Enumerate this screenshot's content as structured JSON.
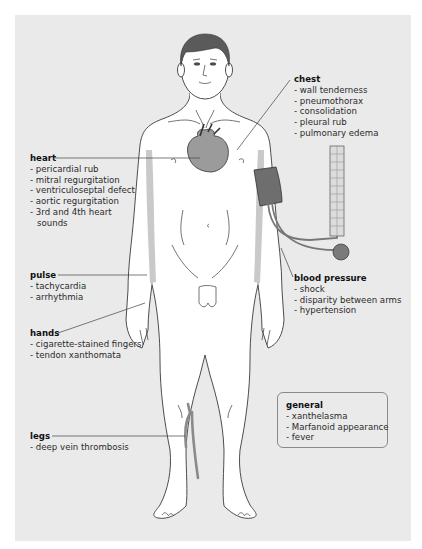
{
  "figure": {
    "colors": {
      "background": "#ffffff",
      "panel": "#eaeaea",
      "skin": "#ffffff",
      "outline": "#3a3a3a",
      "highlight": "#9b9b9b",
      "hair": "#5a5a5a",
      "leader_line": "#444444"
    }
  },
  "labels": {
    "chest": {
      "title": "chest",
      "items": [
        "- wall tenderness",
        "- pneumothorax",
        "- consolidation",
        "- pleural rub",
        "- pulmonary edema"
      ]
    },
    "heart": {
      "title": "heart",
      "items": [
        "- pericardial rub",
        "- mitral regurgitation",
        "- ventriculoseptal defect",
        "- aortic regurgitation",
        "- 3rd and 4th heart",
        "  sounds"
      ]
    },
    "pulse": {
      "title": "pulse",
      "items": [
        "- tachycardia",
        "- arrhythmia"
      ]
    },
    "hands": {
      "title": "hands",
      "items": [
        "- cigarette-stained fingers",
        "- tendon xanthomata"
      ]
    },
    "blood_pressure": {
      "title": "blood pressure",
      "items": [
        "- shock",
        "- disparity between arms",
        "- hypertension"
      ]
    },
    "general": {
      "title": "general",
      "items": [
        "- xanthelasma",
        "- Marfanoid appearance",
        "- fever"
      ]
    },
    "legs": {
      "title": "legs",
      "items": [
        "- deep vein thrombosis"
      ]
    }
  }
}
